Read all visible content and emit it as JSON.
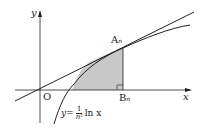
{
  "diagram": {
    "axis_x_label": "x",
    "axis_y_label": "y",
    "origin_label": "O",
    "point_a_label": "A",
    "point_a_sub": "n",
    "point_b_label": "B",
    "point_b_sub": "n",
    "curve_label_prefix": "y=",
    "curve_label_num": "1",
    "curve_label_den": "n",
    "curve_label_den_sup": "2",
    "curve_label_suffix": "ln x",
    "colors": {
      "shade": "#c8c8c8",
      "line": "#222222"
    }
  }
}
